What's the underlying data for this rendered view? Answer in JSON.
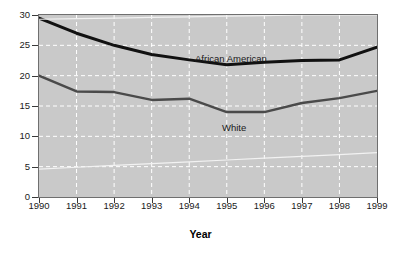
{
  "chart_data": {
    "type": "line",
    "title": "",
    "subtitle": "",
    "xlabel": "Year",
    "ylabel": "",
    "categories": [
      "1990",
      "1991",
      "1992",
      "1993",
      "1994",
      "1995",
      "1996",
      "1997",
      "1998",
      "1999"
    ],
    "x": [
      1990,
      1991,
      1992,
      1993,
      1994,
      1995,
      1996,
      1997,
      1998,
      1999
    ],
    "xlim": [
      1990,
      1999
    ],
    "ylim": [
      0,
      30
    ],
    "yticks": [
      0,
      5,
      10,
      15,
      20,
      25,
      30
    ],
    "ytick_labels": [
      "0",
      "5",
      "10",
      "15",
      "20",
      "25",
      "30"
    ],
    "xtick_labels": [
      "1990",
      "1991",
      "1992",
      "1993",
      "1994",
      "1995",
      "1996",
      "1997",
      "1998",
      "1999"
    ],
    "grid": true,
    "grid_style": "dashed-white",
    "legend": "inline-annotations",
    "legend_position": "inline",
    "plot_background": "#c9c9c9",
    "series": [
      {
        "name": "African American",
        "color": "#111111",
        "width": 3.0,
        "values": [
          29.5,
          27.0,
          25.0,
          23.5,
          22.6,
          21.8,
          22.2,
          22.5,
          22.6,
          24.7
        ]
      },
      {
        "name": "White",
        "color": "#4a4a4a",
        "width": 2.4,
        "values": [
          20.0,
          17.4,
          17.3,
          16.0,
          16.2,
          14.0,
          14.0,
          15.5,
          16.3,
          17.5
        ]
      },
      {
        "name": "artifact-line",
        "color": "#f2f2f2",
        "width": 1.2,
        "values": [
          29.3,
          29.4,
          29.5,
          29.6,
          29.7,
          29.8,
          29.9,
          30.0,
          30.0,
          30.0
        ]
      },
      {
        "name": "artifact-line-lower",
        "color": "#f2f2f2",
        "width": 1.2,
        "values": [
          4.6,
          4.9,
          5.2,
          5.5,
          5.8,
          6.1,
          6.4,
          6.7,
          7.0,
          7.3
        ]
      }
    ],
    "annotations": [
      {
        "text": "African American",
        "x": 1994.2,
        "y": 23.9
      },
      {
        "text": "White",
        "x": 1995.0,
        "y": 12.6
      }
    ]
  },
  "axis": {
    "x_title": "Year"
  }
}
